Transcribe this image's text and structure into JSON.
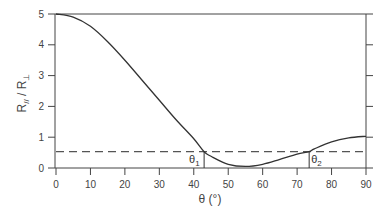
{
  "chart_data": {
    "type": "line",
    "title": "",
    "xlabel": "θ (°)",
    "ylabel": "R// / R⊥",
    "xlim": [
      0,
      90
    ],
    "ylim": [
      0,
      5
    ],
    "x_ticks": [
      "0",
      "10",
      "20",
      "30",
      "40",
      "50",
      "60",
      "70",
      "80",
      "90"
    ],
    "y_ticks": [
      "0",
      "1",
      "2",
      "3",
      "4",
      "5"
    ],
    "grid": false,
    "series": [
      {
        "name": "R// / R⊥",
        "style": "solid",
        "x": [
          0,
          5,
          10,
          15,
          20,
          25,
          30,
          35,
          40,
          43,
          45,
          50,
          55,
          60,
          65,
          70,
          73.5,
          75,
          80,
          85,
          90
        ],
        "y": [
          5.0,
          4.9,
          4.6,
          4.1,
          3.5,
          2.85,
          2.2,
          1.55,
          0.95,
          0.53,
          0.38,
          0.12,
          0.05,
          0.12,
          0.28,
          0.45,
          0.53,
          0.62,
          0.85,
          0.98,
          1.03
        ]
      },
      {
        "name": "threshold",
        "style": "dashed",
        "x": [
          0,
          90
        ],
        "y": [
          0.53,
          0.53
        ]
      }
    ],
    "annotations": [
      {
        "label": "θ1",
        "x": 43,
        "y": 0.53
      },
      {
        "label": "θ2",
        "x": 73.5,
        "y": 0.53
      }
    ]
  },
  "labels": {
    "xlabel": "θ (°)",
    "ylabel_main": "R",
    "ylabel_sub1": "//",
    "ylabel_sep": " / R",
    "ylabel_sub2": "⊥",
    "theta1": "θ",
    "theta1_sub": "1",
    "theta2": "θ",
    "theta2_sub": "2"
  }
}
